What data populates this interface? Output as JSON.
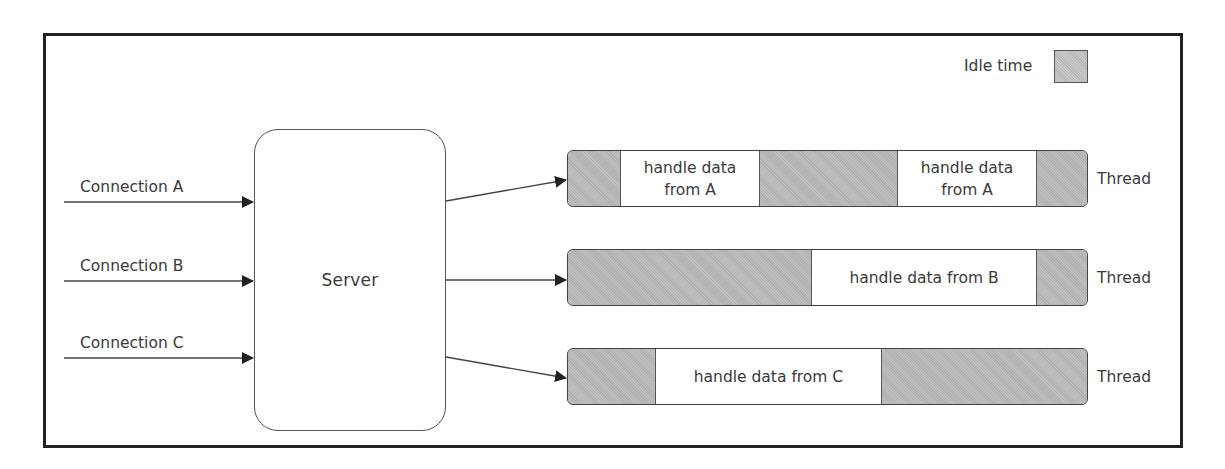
{
  "legend": {
    "label": "Idle time",
    "swatch_color": "#b9b9b9"
  },
  "server": {
    "label": "Server"
  },
  "connections": [
    {
      "label": "Connection A"
    },
    {
      "label": "Connection B"
    },
    {
      "label": "Connection C"
    }
  ],
  "threads": [
    {
      "label": "Thread",
      "segments": [
        {
          "type": "idle",
          "text": ""
        },
        {
          "type": "work",
          "text": "handle data from A"
        },
        {
          "type": "idle",
          "text": ""
        },
        {
          "type": "work",
          "text": "handle data from A"
        },
        {
          "type": "idle",
          "text": ""
        }
      ]
    },
    {
      "label": "Thread",
      "segments": [
        {
          "type": "idle",
          "text": ""
        },
        {
          "type": "work",
          "text": "handle data from B"
        },
        {
          "type": "idle",
          "text": ""
        }
      ]
    },
    {
      "label": "Thread",
      "segments": [
        {
          "type": "idle",
          "text": ""
        },
        {
          "type": "work",
          "text": "handle data from C"
        },
        {
          "type": "idle",
          "text": ""
        }
      ]
    }
  ],
  "colors": {
    "idle": "#b9b9b9",
    "work": "#ffffff",
    "stroke": "#444444",
    "frame": "#222222",
    "text": "#3a3a3a"
  }
}
